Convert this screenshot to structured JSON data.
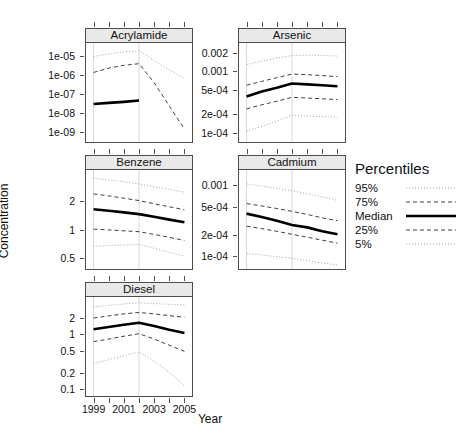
{
  "chart_data": {
    "type": "line",
    "title": "",
    "xlabel": "Year",
    "ylabel": "Concentration",
    "layout": "trellis multi-panel, 2 columns x 3 rows, log y-axis",
    "x": [
      1999,
      2000,
      2001,
      2002,
      2003,
      2004,
      2005
    ],
    "xlim": [
      1998.5,
      2005.5
    ],
    "xticks": [
      1999,
      2000,
      2001,
      2002,
      2003,
      2004,
      2005
    ],
    "xticklabels": [
      "1999",
      "",
      "2001",
      "",
      "2003",
      "",
      "2005"
    ],
    "grid": "vertical reference lines at 1999 and 2002",
    "legend": {
      "title": "Percentiles",
      "position": "right",
      "entries": [
        {
          "label": "95%",
          "style": "dotted-fine"
        },
        {
          "label": "75%",
          "style": "dashed"
        },
        {
          "label": "Median",
          "style": "solid-thick"
        },
        {
          "label": "25%",
          "style": "dashed"
        },
        {
          "label": "5%",
          "style": "dotted-fine"
        }
      ]
    },
    "panels": [
      {
        "name": "Acrylamide",
        "yscale": "log",
        "yticklabels": [
          "1e-05",
          "1e-06",
          "1e-07",
          "1e-08",
          "1e-09"
        ],
        "ytickvalues": [
          1e-05,
          1e-06,
          1e-07,
          1e-08,
          1e-09
        ],
        "ylim": [
          3e-10,
          4e-05
        ],
        "series": [
          {
            "name": "95%",
            "values": [
              8e-06,
              1.1e-05,
              1.4e-05,
              1.6e-05,
              5e-06,
              1.6e-06,
              6e-07
            ]
          },
          {
            "name": "75%",
            "values": [
              1.2e-06,
              2e-06,
              2.8e-06,
              3.4e-06,
              3.5e-07,
              2.2e-08,
              1.4e-09
            ]
          },
          {
            "name": "Median",
            "values": [
              2.8e-08,
              3.2e-08,
              3.6e-08,
              4.2e-08,
              null,
              null,
              null
            ]
          },
          {
            "name": "25%",
            "values": [
              null,
              null,
              null,
              null,
              null,
              null,
              null
            ]
          },
          {
            "name": "5%",
            "values": [
              null,
              null,
              null,
              null,
              null,
              null,
              null
            ]
          }
        ]
      },
      {
        "name": "Arsenic",
        "yscale": "log",
        "yticklabels": [
          "0.002",
          "0.001",
          "5e-04",
          "2e-04",
          "1e-04"
        ],
        "ytickvalues": [
          0.002,
          0.001,
          0.0005,
          0.0002,
          0.0001
        ],
        "ylim": [
          7e-05,
          0.0028
        ],
        "series": [
          {
            "name": "95%",
            "values": [
              0.00125,
              0.00142,
              0.0016,
              0.00175,
              0.00178,
              0.00176,
              0.00172
            ]
          },
          {
            "name": "75%",
            "values": [
              0.00058,
              0.00067,
              0.00077,
              0.00088,
              0.00086,
              0.00083,
              0.0008
            ]
          },
          {
            "name": "Median",
            "values": [
              0.00038,
              0.00046,
              0.00053,
              0.00062,
              0.0006,
              0.00058,
              0.00056
            ]
          },
          {
            "name": "25%",
            "values": [
              0.00024,
              0.00028,
              0.00032,
              0.00037,
              0.00036,
              0.00035,
              0.00034
            ]
          },
          {
            "name": "5%",
            "values": [
              0.000105,
              0.000125,
              0.000152,
              0.00019,
              0.000185,
              0.00018,
              0.000175
            ]
          }
        ]
      },
      {
        "name": "Benzene",
        "yscale": "log",
        "yticklabels": [
          "2",
          "1",
          "0.5"
        ],
        "ytickvalues": [
          2,
          1,
          0.5
        ],
        "ylim": [
          0.38,
          4.2
        ],
        "series": [
          {
            "name": "95%",
            "values": [
              3.45,
              3.3,
              3.15,
              3.0,
              2.8,
              2.62,
              2.45
            ]
          },
          {
            "name": "75%",
            "values": [
              2.35,
              2.24,
              2.12,
              2.0,
              1.85,
              1.72,
              1.6
            ]
          },
          {
            "name": "Median",
            "values": [
              1.62,
              1.56,
              1.5,
              1.44,
              1.35,
              1.26,
              1.18
            ]
          },
          {
            "name": "25%",
            "values": [
              1.0,
              0.98,
              0.96,
              0.94,
              0.88,
              0.82,
              0.76
            ]
          },
          {
            "name": "5%",
            "values": [
              0.66,
              0.67,
              0.68,
              0.69,
              0.63,
              0.57,
              0.52
            ]
          }
        ]
      },
      {
        "name": "Cadmium",
        "yscale": "log",
        "yticklabels": [
          "0.001",
          "5e-04",
          "2e-04",
          "1e-04"
        ],
        "ytickvalues": [
          0.001,
          0.0005,
          0.0002,
          0.0001
        ],
        "ylim": [
          6.5e-05,
          0.0016
        ],
        "series": [
          {
            "name": "95%",
            "values": [
              0.00102,
              0.00095,
              0.00088,
              0.00082,
              0.00074,
              0.00067,
              0.0006
            ]
          },
          {
            "name": "75%",
            "values": [
              0.00054,
              0.0005,
              0.00046,
              0.00042,
              0.00038,
              0.00034,
              0.00031
            ]
          },
          {
            "name": "Median",
            "values": [
              0.00039,
              0.00035,
              0.00031,
              0.00027,
              0.00025,
              0.00022,
              0.0002
            ]
          },
          {
            "name": "25%",
            "values": [
              0.00026,
              0.00024,
              0.00022,
              0.0002,
              0.000182,
              0.000165,
              0.00015
            ]
          },
          {
            "name": "5%",
            "values": [
              0.000108,
              0.000102,
              9.7e-05,
              9.2e-05,
              8.5e-05,
              7.9e-05,
              7.4e-05
            ]
          }
        ]
      },
      {
        "name": "Diesel",
        "yscale": "log",
        "yticklabels": [
          "2",
          "1",
          "0.5",
          "0.2",
          "0.1"
        ],
        "ytickvalues": [
          2,
          1,
          0.5,
          0.2,
          0.1
        ],
        "ylim": [
          0.075,
          4.6
        ],
        "series": [
          {
            "name": "95%",
            "values": [
              3.05,
              3.25,
              3.45,
              3.6,
              3.5,
              3.4,
              3.3
            ]
          },
          {
            "name": "75%",
            "values": [
              1.92,
              2.1,
              2.28,
              2.42,
              2.28,
              2.12,
              1.98
            ]
          },
          {
            "name": "Median",
            "values": [
              1.2,
              1.32,
              1.45,
              1.58,
              1.38,
              1.18,
              1.03
            ]
          },
          {
            "name": "25%",
            "values": [
              0.72,
              0.8,
              0.9,
              1.0,
              0.8,
              0.62,
              0.48
            ]
          },
          {
            "name": "5%",
            "values": [
              0.29,
              0.34,
              0.4,
              0.47,
              0.32,
              0.2,
              0.115
            ]
          }
        ]
      }
    ]
  }
}
